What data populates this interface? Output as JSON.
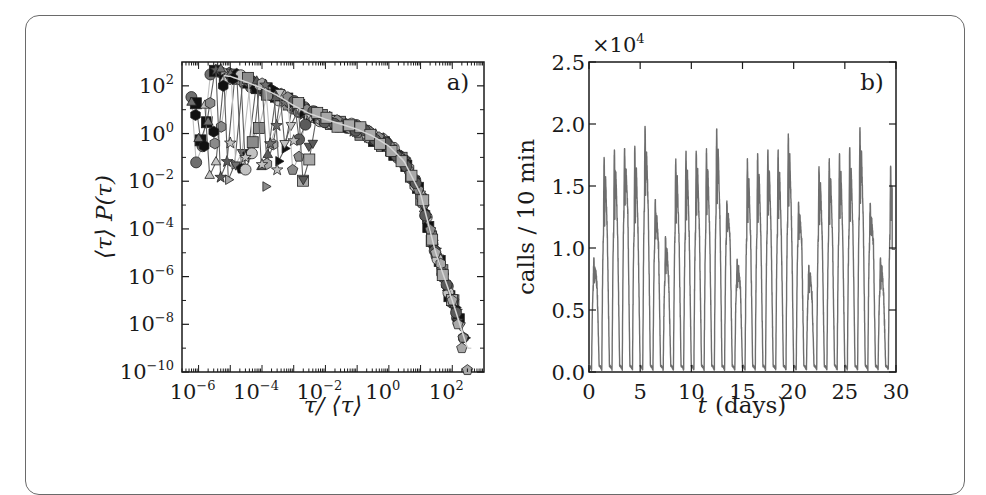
{
  "chart_data": [
    {
      "panel": "a)",
      "type": "scatter",
      "title": "",
      "xlabel": "τ/ ⟨τ⟩",
      "ylabel": "⟨τ⟩ P(τ)",
      "xscale": "log",
      "yscale": "log",
      "xlim": [
        3e-07,
        1000
      ],
      "ylim": [
        1e-10,
        1000
      ],
      "x_ticks": [
        "10^-6",
        "10^-4",
        "10^-2",
        "10^0",
        "10^2"
      ],
      "y_ticks": [
        "10^-10",
        "10^-8",
        "10^-6",
        "10^-4",
        "10^-2",
        "10^0",
        "10^2"
      ],
      "grid": false,
      "legend": null,
      "annotation": "a)",
      "description": "Rescaled inter-event time distributions for many groups (markers: circles, squares, triangles, pentagons, hexagons, stars, crosses in black/gray/light gray), collapsing onto a common curve that decays slowly then sharply beyond τ/⟨τ⟩≈10.",
      "master_curve": {
        "x": [
          3e-06,
          1e-05,
          3e-05,
          0.0001,
          0.0003,
          0.001,
          0.003,
          0.01,
          0.03,
          0.1,
          0.3,
          1,
          3,
          10,
          30,
          100,
          300
        ],
        "y": [
          300,
          250,
          150,
          80,
          40,
          15,
          7,
          4,
          2.5,
          1.5,
          0.8,
          0.3,
          0.07,
          0.003,
          1e-05,
          1e-07,
          1e-09
        ]
      },
      "series": [
        {
          "name": "light-gray squares",
          "x": [
            6e-07,
            1e-06,
            2e-06,
            5e-06,
            1e-05
          ],
          "y": [
            20,
            0.6,
            3,
            500,
            300
          ]
        },
        {
          "name": "black hexagons",
          "x": [
            8e-07,
            1.5e-06,
            3e-06,
            6e-06,
            1.2e-05
          ],
          "y": [
            6,
            0.3,
            1.2,
            100,
            200
          ]
        },
        {
          "name": "gray circles",
          "x": [
            1e-05,
            3e-05,
            0.0001,
            0.0003,
            0.001
          ],
          "y": [
            0.4,
            0.1,
            0.05,
            0.03,
            0.5
          ]
        },
        {
          "name": "gray hexagon min",
          "x": [
            0.00013
          ],
          "y": [
            0.006
          ]
        },
        {
          "name": "gray right-triangles",
          "x": [
            0.002,
            0.003,
            0.004
          ],
          "y": [
            0.012,
            0.3,
            0.4
          ]
        },
        {
          "name": "tail markers",
          "x": [
            30,
            100,
            150,
            200,
            300
          ],
          "y": [
            1e-05,
            1e-07,
            1e-08,
            1e-09,
            1e-10
          ]
        }
      ]
    },
    {
      "panel": "b)",
      "type": "line",
      "title": "",
      "xlabel": "t (days)",
      "ylabel": "calls / 10 min",
      "y_multiplier": "×10^4",
      "xlim": [
        0,
        30
      ],
      "ylim": [
        0.0,
        2.5
      ],
      "x_ticks": [
        "0",
        "5",
        "10",
        "15",
        "20",
        "25",
        "30"
      ],
      "y_ticks": [
        "0.0",
        "0.5",
        "1.0",
        "1.5",
        "2.0",
        "2.5"
      ],
      "grid": false,
      "legend": null,
      "annotation": "b)",
      "line_color": "#6e6e6e",
      "description": "Call volume per 10-minute window over 30 days; strong daily oscillation dropping to ~0 at night, with lower peaks on weekends (weekly cycle).",
      "series": [
        {
          "name": "calls / 10 min (×10^4)",
          "day": [
            0,
            1,
            2,
            3,
            4,
            5,
            6,
            7,
            8,
            9,
            10,
            11,
            12,
            13,
            14,
            15,
            16,
            17,
            18,
            19,
            20,
            21,
            22,
            23,
            24,
            25,
            26,
            27,
            28,
            29
          ],
          "daily_peak": [
            0.92,
            1.73,
            1.79,
            1.8,
            1.82,
            1.98,
            1.39,
            1.09,
            1.72,
            1.78,
            1.78,
            1.8,
            1.96,
            1.38,
            0.91,
            1.72,
            1.76,
            1.79,
            1.79,
            1.92,
            1.37,
            0.86,
            1.66,
            1.72,
            1.76,
            1.81,
            1.97,
            1.36,
            0.92,
            1.66
          ],
          "daily_midday_dip": [
            0.68,
            1.1,
            1.12,
            1.28,
            1.12,
            1.3,
            1.0,
            0.72,
            1.1,
            1.1,
            1.12,
            1.12,
            1.25,
            1.05,
            0.68,
            1.08,
            1.1,
            1.12,
            1.1,
            1.2,
            1.02,
            0.6,
            1.08,
            1.08,
            1.1,
            1.12,
            1.25,
            1.02,
            0.62,
            1.1
          ],
          "nightly_min": 0.0
        }
      ]
    }
  ],
  "panels": {
    "a": {
      "tag": "a)",
      "xlabel": "τ/ ⟨τ⟩",
      "ylabel": "⟨τ⟩ P(τ)",
      "x_ticks": [
        {
          "base": "10",
          "exp": "−6"
        },
        {
          "base": "10",
          "exp": "−4"
        },
        {
          "base": "10",
          "exp": "−2"
        },
        {
          "base": "10",
          "exp": "0"
        },
        {
          "base": "10",
          "exp": "2"
        }
      ],
      "y_ticks": [
        {
          "base": "10",
          "exp": "2"
        },
        {
          "base": "10",
          "exp": "0"
        },
        {
          "base": "10",
          "exp": "−2"
        },
        {
          "base": "10",
          "exp": "−4"
        },
        {
          "base": "10",
          "exp": "−6"
        },
        {
          "base": "10",
          "exp": "−8"
        },
        {
          "base": "10",
          "exp": "−10"
        }
      ]
    },
    "b": {
      "tag": "b)",
      "xlabel_var": "t",
      "xlabel_unit": "(days)",
      "ylabel": "calls / 10 min",
      "multiplier_base": "×10",
      "multiplier_exp": "4",
      "x_ticks": [
        "0",
        "5",
        "10",
        "15",
        "20",
        "25",
        "30"
      ],
      "y_ticks": [
        "0.0",
        "0.5",
        "1.0",
        "1.5",
        "2.0",
        "2.5"
      ]
    }
  }
}
